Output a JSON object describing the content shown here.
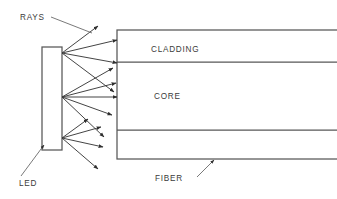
{
  "diagram": {
    "title_text": "",
    "background_color": "#ffffff",
    "line_color": "#575757",
    "ray_color": "#3a3a3a",
    "text_color": "#3b3b3b",
    "labels": {
      "rays": "RAYS",
      "led": "LED",
      "cladding": "CLADDING",
      "core": "CORE",
      "fiber": "FIBER"
    },
    "label_positions": {
      "rays": {
        "x": 20,
        "y": 20
      },
      "led": {
        "x": 19,
        "y": 186
      },
      "cladding": {
        "x": 151,
        "y": 52
      },
      "core": {
        "x": 154,
        "y": 99
      },
      "fiber": {
        "x": 155,
        "y": 181
      }
    },
    "led_source": {
      "name": "LED",
      "x": 42,
      "y": 47,
      "width": 20,
      "height": 103,
      "emission_points": [
        {
          "x": 62,
          "y": 53
        },
        {
          "x": 62,
          "y": 97
        },
        {
          "x": 62,
          "y": 138
        }
      ]
    },
    "fiber": {
      "name": "FIBER",
      "left": 117,
      "right": 337,
      "top": 30,
      "bottom": 159,
      "boundaries_y": [
        30,
        62,
        130,
        159
      ],
      "regions": [
        {
          "label": "CLADDING",
          "top": 30,
          "bottom": 62
        },
        {
          "label": "CORE",
          "top": 62,
          "bottom": 130
        },
        {
          "label": "CLADDING",
          "top": 130,
          "bottom": 159
        }
      ]
    },
    "rays": [
      {
        "from_point": 0,
        "x1": 62,
        "y1": 53,
        "x2": 98,
        "y2": 26
      },
      {
        "from_point": 0,
        "x1": 62,
        "y1": 53,
        "x2": 117,
        "y2": 40
      },
      {
        "from_point": 0,
        "x1": 62,
        "y1": 53,
        "x2": 117,
        "y2": 63
      },
      {
        "from_point": 0,
        "x1": 62,
        "y1": 53,
        "x2": 114,
        "y2": 92
      },
      {
        "from_point": 1,
        "x1": 62,
        "y1": 97,
        "x2": 113,
        "y2": 68
      },
      {
        "from_point": 1,
        "x1": 62,
        "y1": 97,
        "x2": 116,
        "y2": 83
      },
      {
        "from_point": 1,
        "x1": 62,
        "y1": 97,
        "x2": 117,
        "y2": 97
      },
      {
        "from_point": 1,
        "x1": 62,
        "y1": 97,
        "x2": 112,
        "y2": 115
      },
      {
        "from_point": 1,
        "x1": 62,
        "y1": 97,
        "x2": 104,
        "y2": 137
      },
      {
        "from_point": 2,
        "x1": 62,
        "y1": 138,
        "x2": 88,
        "y2": 119
      },
      {
        "from_point": 2,
        "x1": 62,
        "y1": 138,
        "x2": 101,
        "y2": 127
      },
      {
        "from_point": 2,
        "x1": 62,
        "y1": 138,
        "x2": 103,
        "y2": 147
      },
      {
        "from_point": 2,
        "x1": 62,
        "y1": 138,
        "x2": 98,
        "y2": 169
      }
    ],
    "leaders": [
      {
        "for": "RAYS",
        "x1": 51,
        "y1": 17,
        "x2": 92,
        "y2": 33,
        "has_arrow": false
      },
      {
        "for": "LED",
        "x1": 21,
        "y1": 176,
        "x2": 44,
        "y2": 145,
        "has_arrow": true
      },
      {
        "for": "FIBER",
        "x1": 197,
        "y1": 177,
        "x2": 214,
        "y2": 160,
        "has_arrow": true
      }
    ]
  }
}
